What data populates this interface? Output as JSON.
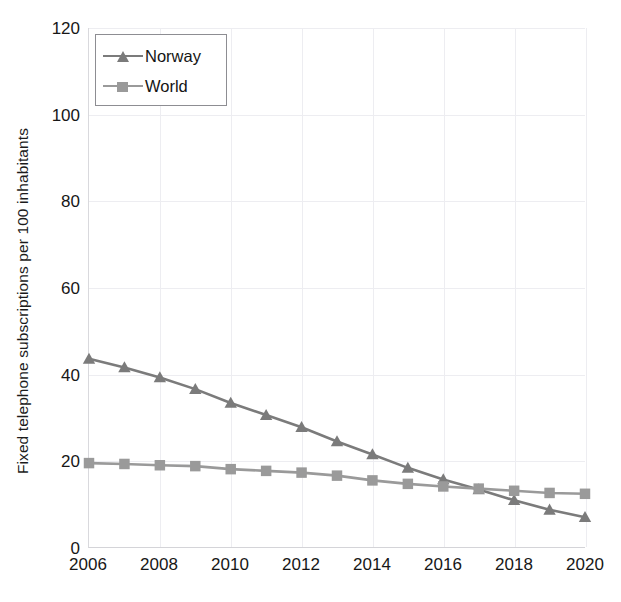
{
  "chart_data": {
    "type": "line",
    "title": "",
    "xlabel": "",
    "ylabel": "Fixed telephone subscriptions per 100 inhabitants",
    "x": [
      2006,
      2007,
      2008,
      2009,
      2010,
      2011,
      2012,
      2013,
      2014,
      2015,
      2016,
      2017,
      2018,
      2019,
      2020
    ],
    "xlim": [
      2006,
      2020
    ],
    "ylim": [
      0,
      120
    ],
    "ytick_labels": [
      "0",
      "20",
      "40",
      "60",
      "80",
      "100",
      "120"
    ],
    "yticks": [
      0,
      20,
      40,
      60,
      80,
      100,
      120
    ],
    "xtick_labels": [
      "2006",
      "2008",
      "2010",
      "2012",
      "2014",
      "2016",
      "2018",
      "2020"
    ],
    "xticks": [
      2006,
      2008,
      2010,
      2012,
      2014,
      2016,
      2018,
      2020
    ],
    "grid": true,
    "legend_position": "top-left",
    "series": [
      {
        "name": "Norway",
        "marker": "triangle",
        "color": "#7b7b7b",
        "values": [
          43.5,
          41.5,
          39.2,
          36.5,
          33.3,
          30.5,
          27.7,
          24.4,
          21.4,
          18.3,
          15.6,
          13.3,
          10.8,
          8.6,
          6.9
        ]
      },
      {
        "name": "World",
        "marker": "square",
        "color": "#9a9a9a",
        "values": [
          19.4,
          19.2,
          18.9,
          18.7,
          18.0,
          17.6,
          17.2,
          16.5,
          15.4,
          14.6,
          14.0,
          13.5,
          13.0,
          12.5,
          12.3
        ]
      }
    ]
  },
  "legend": {
    "entries": [
      {
        "label": "Norway",
        "marker": "triangle-marker-icon"
      },
      {
        "label": "World",
        "marker": "square-marker-icon"
      }
    ]
  },
  "colors": {
    "norway_line": "#7b7b7b",
    "world_line": "#9a9a9a",
    "grid": "#ededf1",
    "axis": "#d4d4d8",
    "text": "#171717",
    "background": "#ffffff"
  }
}
